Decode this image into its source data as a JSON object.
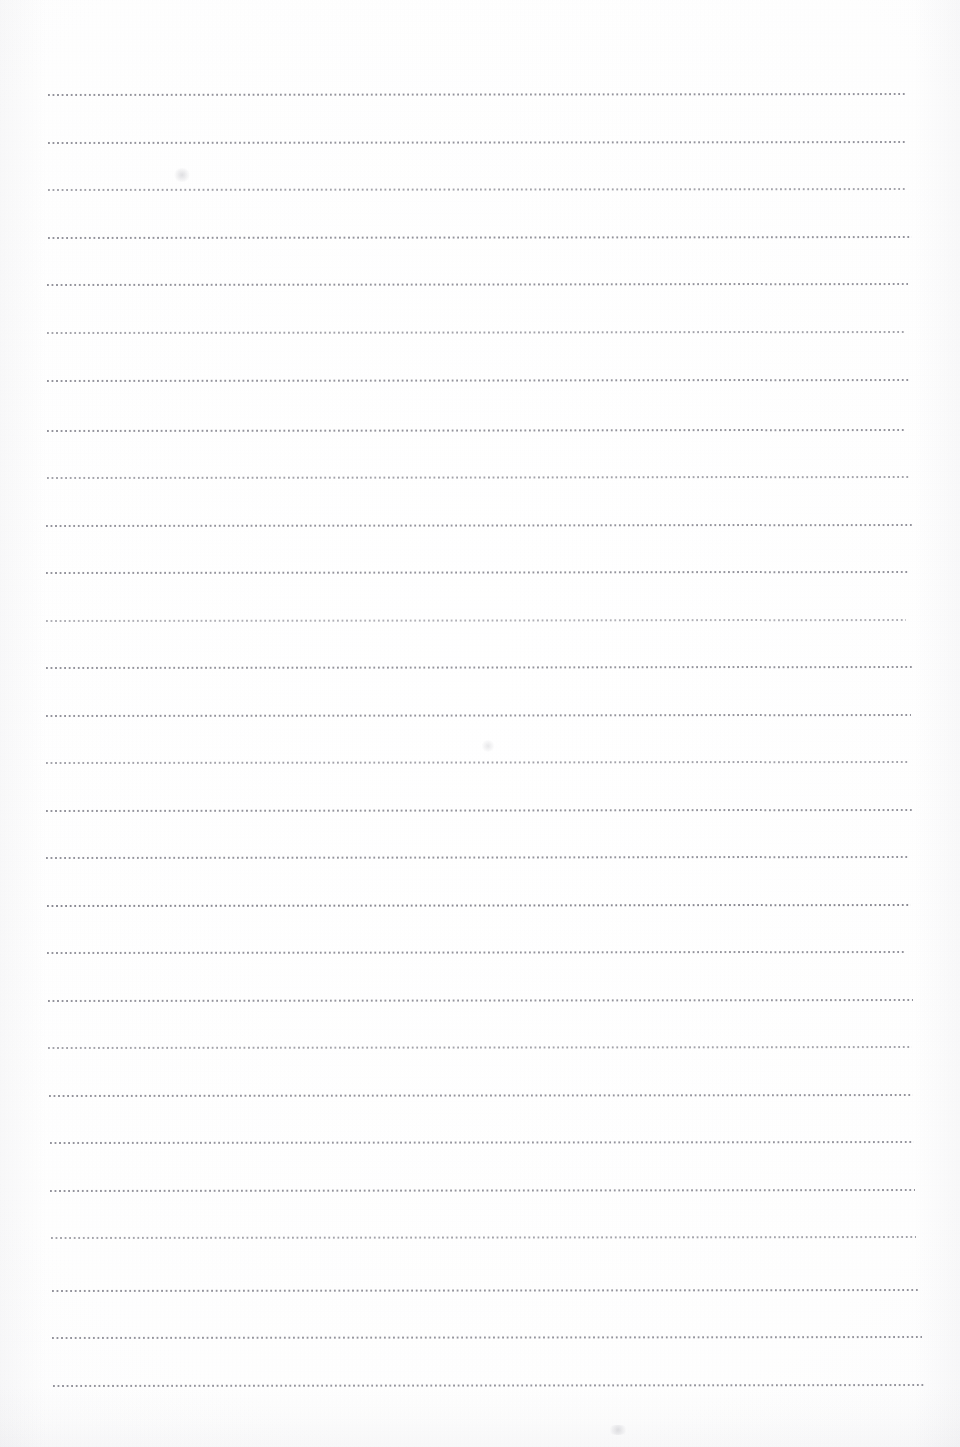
{
  "document": {
    "kind": "blank-lined-notebook-page",
    "title": "",
    "body_text": "",
    "page_number": "",
    "header_text": "",
    "footer_text": "",
    "background_color": "#fdfdfd",
    "rule_color": "#7c7c86",
    "rule_style": "dotted",
    "page_width_px": 960,
    "page_height_px": 1447,
    "rule_count": 28,
    "rule_spacing_px": 47.6,
    "first_rule_y_px": 94,
    "rule_left_x_px": 49,
    "rule_right_x_px": 910,
    "rule_slope_deg": -0.07
  },
  "rules": [
    {
      "index": 1,
      "y": 94,
      "x_start": 48,
      "x_end": 907,
      "weight": "normal"
    },
    {
      "index": 2,
      "y": 142,
      "x_start": 48,
      "x_end": 906,
      "weight": "normal"
    },
    {
      "index": 3,
      "y": 189,
      "x_start": 48,
      "x_end": 905,
      "weight": "light"
    },
    {
      "index": 4,
      "y": 237,
      "x_start": 48,
      "x_end": 912,
      "weight": "normal"
    },
    {
      "index": 5,
      "y": 284,
      "x_start": 47,
      "x_end": 908,
      "weight": "normal"
    },
    {
      "index": 6,
      "y": 332,
      "x_start": 47,
      "x_end": 905,
      "weight": "light"
    },
    {
      "index": 7,
      "y": 380,
      "x_start": 47,
      "x_end": 910,
      "weight": "normal"
    },
    {
      "index": 8,
      "y": 430,
      "x_start": 47,
      "x_end": 905,
      "weight": "normal"
    },
    {
      "index": 9,
      "y": 477,
      "x_start": 47,
      "x_end": 910,
      "weight": "light"
    },
    {
      "index": 10,
      "y": 525,
      "x_start": 46,
      "x_end": 912,
      "weight": "normal"
    },
    {
      "index": 11,
      "y": 572,
      "x_start": 46,
      "x_end": 908,
      "weight": "normal"
    },
    {
      "index": 12,
      "y": 620,
      "x_start": 46,
      "x_end": 906,
      "weight": "lighter"
    },
    {
      "index": 13,
      "y": 667,
      "x_start": 46,
      "x_end": 912,
      "weight": "normal"
    },
    {
      "index": 14,
      "y": 715,
      "x_start": 46,
      "x_end": 911,
      "weight": "normal"
    },
    {
      "index": 15,
      "y": 762,
      "x_start": 46,
      "x_end": 908,
      "weight": "light"
    },
    {
      "index": 16,
      "y": 810,
      "x_start": 46,
      "x_end": 912,
      "weight": "normal"
    },
    {
      "index": 17,
      "y": 857,
      "x_start": 46,
      "x_end": 908,
      "weight": "normal"
    },
    {
      "index": 18,
      "y": 905,
      "x_start": 47,
      "x_end": 911,
      "weight": "dark"
    },
    {
      "index": 19,
      "y": 952,
      "x_start": 47,
      "x_end": 906,
      "weight": "normal"
    },
    {
      "index": 20,
      "y": 1000,
      "x_start": 48,
      "x_end": 913,
      "weight": "normal"
    },
    {
      "index": 21,
      "y": 1047,
      "x_start": 48,
      "x_end": 912,
      "weight": "light"
    },
    {
      "index": 22,
      "y": 1095,
      "x_start": 49,
      "x_end": 913,
      "weight": "normal"
    },
    {
      "index": 23,
      "y": 1142,
      "x_start": 50,
      "x_end": 914,
      "weight": "normal"
    },
    {
      "index": 24,
      "y": 1190,
      "x_start": 50,
      "x_end": 915,
      "weight": "normal"
    },
    {
      "index": 25,
      "y": 1237,
      "x_start": 51,
      "x_end": 916,
      "weight": "light"
    },
    {
      "index": 26,
      "y": 1290,
      "x_start": 52,
      "x_end": 920,
      "weight": "normal"
    },
    {
      "index": 27,
      "y": 1337,
      "x_start": 52,
      "x_end": 922,
      "weight": "normal"
    },
    {
      "index": 28,
      "y": 1385,
      "x_start": 53,
      "x_end": 925,
      "weight": "normal"
    }
  ],
  "marks": [
    {
      "name": "faint-smudge-upper-left",
      "x": 173,
      "y": 168,
      "w": 18,
      "h": 14
    },
    {
      "name": "faint-smudge-mid-center",
      "x": 481,
      "y": 740,
      "w": 14,
      "h": 12
    },
    {
      "name": "faint-smudge-bottom",
      "x": 607,
      "y": 1425,
      "w": 22,
      "h": 10
    }
  ]
}
